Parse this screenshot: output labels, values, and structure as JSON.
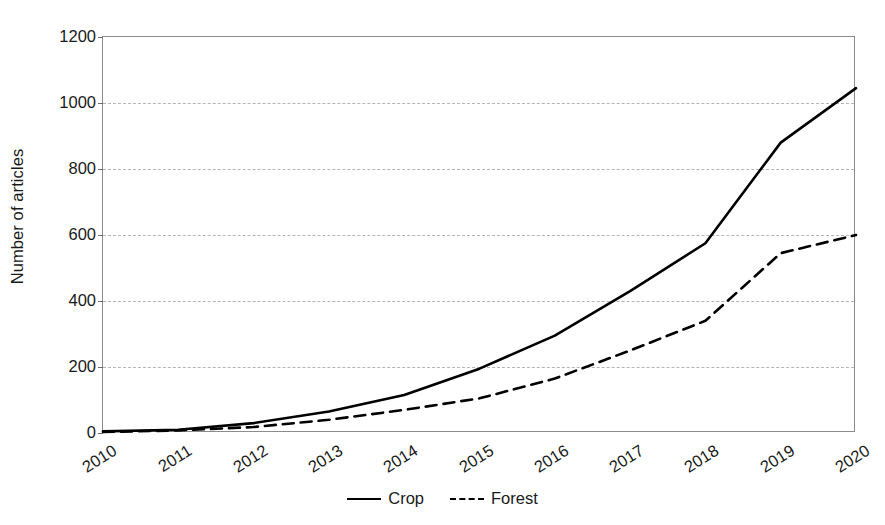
{
  "chart_data": {
    "type": "line",
    "title": "",
    "xlabel": "",
    "ylabel": "Number of articles",
    "ylim": [
      0,
      1200
    ],
    "yticks": [
      0,
      200,
      400,
      600,
      800,
      1000,
      1200
    ],
    "ytick_labels": [
      "0",
      "200",
      "400",
      "600",
      "800",
      "1000",
      "1200"
    ],
    "categories": [
      "2010",
      "2011",
      "2012",
      "2013",
      "2014",
      "2015",
      "2016",
      "2017",
      "2018",
      "2019",
      "2020"
    ],
    "x": [
      2010,
      2011,
      2012,
      2013,
      2014,
      2015,
      2016,
      2017,
      2018,
      2019,
      2020
    ],
    "grid": "horizontal",
    "legend_position": "bottom-center",
    "series": [
      {
        "name": "Crop",
        "style": "solid",
        "color": "#000000",
        "values": [
          5,
          10,
          30,
          65,
          115,
          195,
          295,
          430,
          575,
          880,
          1045
        ]
      },
      {
        "name": "Forest",
        "style": "dashed",
        "color": "#000000",
        "values": [
          3,
          8,
          18,
          40,
          70,
          105,
          165,
          250,
          340,
          545,
          600
        ]
      }
    ]
  },
  "axis": {
    "y_title": "Number of articles"
  },
  "legend": {
    "items": [
      {
        "label": "Crop",
        "style": "solid"
      },
      {
        "label": "Forest",
        "style": "dashed"
      }
    ]
  },
  "colors": {
    "series_line": "#000000",
    "gridline": "#b4b4b4",
    "frame": "#8c8c8c",
    "text": "#1a1a1a",
    "background": "#ffffff"
  }
}
